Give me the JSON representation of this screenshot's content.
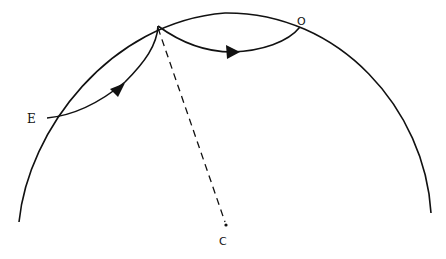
{
  "diagram": {
    "type": "geometric path diagram",
    "labels": {
      "e": "E",
      "o": "O",
      "c": "C"
    },
    "elements": {
      "outer_arc": "large circular arc (boundary)",
      "path_e_to_apex": "curved path from E to apex with arrow",
      "path_apex_to_o": "curved path from apex to O with arrow",
      "radius_line": "dashed line from apex to center C",
      "center_point": "dot at C"
    },
    "colors": {
      "stroke": "#111111",
      "background": "#ffffff"
    }
  }
}
